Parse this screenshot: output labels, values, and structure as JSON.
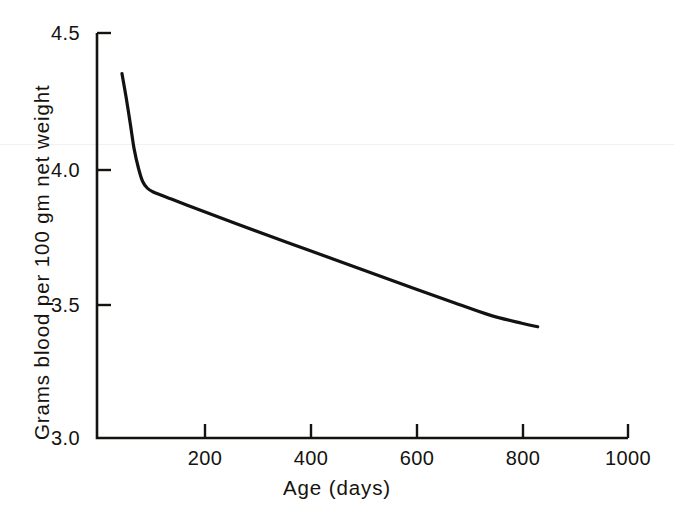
{
  "chart_data": {
    "type": "line",
    "title": "",
    "subtitle": "",
    "xlabel": "Age (days)",
    "ylabel": "Grams blood per 100 gm net weight",
    "xlim": [
      0,
      1000
    ],
    "ylim": [
      3.0,
      4.5
    ],
    "xticks": [
      0,
      200,
      400,
      600,
      800,
      1000
    ],
    "xticklabels": [
      "",
      "200",
      "400",
      "600",
      "800",
      "1000"
    ],
    "yticks": [
      3.0,
      3.5,
      4.0,
      4.5
    ],
    "yticklabels": [
      "3.0",
      "3.5",
      "4.0",
      "4.5"
    ],
    "grid": false,
    "legend": null,
    "legend_position": "none",
    "series": [
      {
        "name": "Blood volume vs age",
        "color": "#121212",
        "linewidth": 3.2,
        "x": [
          47,
          55,
          63,
          70,
          78,
          86,
          95,
          105,
          120,
          140,
          170,
          210,
          260,
          320,
          390,
          460,
          530,
          600,
          670,
          740,
          800,
          830
        ],
        "y": [
          4.35,
          4.26,
          4.16,
          4.07,
          4.0,
          3.95,
          3.925,
          3.912,
          3.9,
          3.885,
          3.862,
          3.832,
          3.795,
          3.752,
          3.702,
          3.652,
          3.602,
          3.552,
          3.503,
          3.455,
          3.425,
          3.412
        ]
      }
    ],
    "annotations": []
  },
  "axis": {
    "x_title": "Age (days)",
    "y_title": "Grams blood per 100 gm net weight",
    "x_tick_labels": [
      "200",
      "400",
      "600",
      "800",
      "1000"
    ],
    "y_tick_labels": [
      "4.5",
      "4.0",
      "3.5",
      "3.0"
    ]
  },
  "style": {
    "background": "#ffffff",
    "axis_color": "#15130f",
    "curve_color": "#121212"
  }
}
